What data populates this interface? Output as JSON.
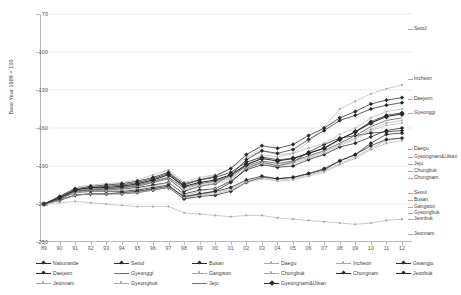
{
  "chart": {
    "type": "line",
    "title": "",
    "ylabel": "Base Year 1989 = 100",
    "xlabel": "",
    "ylim": [
      70,
      250
    ],
    "yticks": [
      "250",
      "220",
      "190",
      "160",
      "130",
      "100",
      "70"
    ],
    "ytick_values": [
      250,
      220,
      190,
      160,
      130,
      100,
      70
    ],
    "grid": true,
    "legend_position": "bottom"
  },
  "chart_data": {
    "type": "line",
    "title": "",
    "xlabel": "",
    "ylabel": "Base Year 1989 = 100",
    "ylim": [
      70,
      250
    ],
    "yticks": [
      70,
      100,
      130,
      160,
      190,
      220,
      250
    ],
    "grid": true,
    "legend_position": "bottom",
    "categories": [
      "89",
      "90",
      "91",
      "92",
      "93",
      "94",
      "95",
      "96",
      "97",
      "98",
      "99",
      "00",
      "01",
      "02",
      "03",
      "04",
      "05",
      "06",
      "07",
      "08",
      "09",
      "10",
      "11",
      "12"
    ],
    "series": [
      {
        "name": "Nationwide",
        "style": "marker-line-dark",
        "values": [
          100,
          105,
          110,
          111,
          111,
          112,
          113,
          115,
          117,
          108,
          111,
          112,
          118,
          127,
          131,
          129,
          130,
          135,
          139,
          145,
          148,
          153,
          158,
          160
        ]
      },
      {
        "name": "Seoul",
        "style": "marker-line-dark",
        "values": [
          100,
          104,
          109,
          110,
          110,
          110,
          111,
          113,
          115,
          105,
          108,
          110,
          117,
          128,
          133,
          130,
          133,
          141,
          147,
          152,
          154,
          156,
          157,
          158
        ]
      },
      {
        "name": "Busan",
        "style": "marker-line-dark",
        "values": [
          100,
          103,
          107,
          108,
          108,
          108,
          109,
          111,
          113,
          104,
          106,
          107,
          110,
          117,
          121,
          120,
          121,
          124,
          127,
          134,
          139,
          148,
          155,
          156
        ]
      },
      {
        "name": "Daegu",
        "style": "thin-light",
        "values": [
          100,
          106,
          113,
          115,
          116,
          117,
          119,
          123,
          127,
          117,
          121,
          123,
          128,
          137,
          142,
          139,
          140,
          144,
          148,
          155,
          160,
          168,
          173,
          175
        ]
      },
      {
        "name": "Incheon",
        "style": "thin-light",
        "values": [
          100,
          104,
          109,
          110,
          110,
          111,
          112,
          114,
          117,
          107,
          110,
          112,
          119,
          131,
          139,
          137,
          140,
          149,
          161,
          175,
          181,
          187,
          191,
          194
        ]
      },
      {
        "name": "Gwangju",
        "style": "marker-line-dark",
        "values": [
          100,
          106,
          112,
          114,
          115,
          116,
          118,
          121,
          125,
          116,
          119,
          121,
          125,
          133,
          137,
          135,
          136,
          140,
          144,
          151,
          157,
          165,
          170,
          172
        ]
      },
      {
        "name": "Daejeon",
        "style": "marker-line-dark",
        "values": [
          100,
          105,
          111,
          113,
          114,
          115,
          117,
          120,
          124,
          115,
          119,
          122,
          128,
          139,
          146,
          144,
          147,
          154,
          160,
          168,
          173,
          179,
          182,
          184
        ]
      },
      {
        "name": "Gyeonggi",
        "style": "marker-line-dark",
        "values": [
          100,
          104,
          110,
          111,
          112,
          113,
          114,
          117,
          120,
          110,
          114,
          116,
          123,
          135,
          142,
          140,
          143,
          151,
          158,
          166,
          170,
          175,
          178,
          180
        ]
      },
      {
        "name": "Gangwon",
        "style": "thin-light",
        "values": [
          100,
          103,
          107,
          108,
          108,
          109,
          110,
          112,
          114,
          106,
          108,
          109,
          112,
          118,
          121,
          119,
          120,
          123,
          126,
          132,
          137,
          144,
          150,
          152
        ]
      },
      {
        "name": "Chungbuk",
        "style": "thin-light",
        "values": [
          100,
          105,
          110,
          112,
          112,
          113,
          115,
          118,
          121,
          112,
          115,
          117,
          121,
          129,
          133,
          131,
          133,
          137,
          141,
          147,
          152,
          159,
          164,
          166
        ]
      },
      {
        "name": "Chungnam",
        "style": "thin-light",
        "values": [
          100,
          104,
          109,
          111,
          111,
          112,
          114,
          117,
          120,
          111,
          114,
          116,
          120,
          128,
          132,
          130,
          132,
          136,
          140,
          146,
          151,
          158,
          162,
          164
        ]
      },
      {
        "name": "Jeonbuk",
        "style": "marker-line-dark",
        "values": [
          100,
          103,
          107,
          108,
          108,
          109,
          110,
          112,
          114,
          106,
          108,
          110,
          113,
          119,
          122,
          120,
          121,
          124,
          128,
          134,
          139,
          146,
          151,
          152
        ]
      },
      {
        "name": "Jeonnam",
        "style": "thin-light",
        "values": [
          100,
          101,
          102,
          101,
          100,
          99,
          98,
          98,
          98,
          93,
          92,
          91,
          90,
          91,
          91,
          89,
          88,
          87,
          86,
          85,
          84,
          85,
          87,
          88
        ]
      },
      {
        "name": "Gyeongbuk",
        "style": "thin-light",
        "values": [
          100,
          103,
          107,
          108,
          108,
          108,
          109,
          111,
          113,
          105,
          107,
          108,
          111,
          117,
          120,
          118,
          119,
          122,
          125,
          131,
          136,
          143,
          148,
          150
        ]
      },
      {
        "name": "Jeju",
        "style": "thick-dark",
        "values": [
          100,
          105,
          110,
          112,
          112,
          113,
          115,
          118,
          121,
          113,
          116,
          118,
          122,
          130,
          134,
          132,
          134,
          138,
          142,
          148,
          154,
          161,
          166,
          168
        ]
      },
      {
        "name": "Gyeongnam&Ulsan",
        "style": "marker-line-bold",
        "values": [
          100,
          105,
          111,
          113,
          113,
          114,
          116,
          119,
          123,
          114,
          117,
          119,
          123,
          131,
          136,
          134,
          136,
          140,
          144,
          151,
          157,
          164,
          169,
          171
        ]
      }
    ]
  },
  "end_labels": [
    {
      "name": "Seoul",
      "top": 26
    },
    {
      "name": "Incheon",
      "top": 76
    },
    {
      "name": "Daejeon",
      "top": 96
    },
    {
      "name": "Gyeonggi",
      "top": 110
    },
    {
      "name": "Daegu",
      "top": 146
    },
    {
      "name": "Gyeongnam&Ulsan",
      "top": 154
    },
    {
      "name": "Jeju",
      "top": 161
    },
    {
      "name": "Chungbuk",
      "top": 168
    },
    {
      "name": "Chungnam",
      "top": 175
    },
    {
      "name": "Seoul",
      "top": 190
    },
    {
      "name": "Busan",
      "top": 197
    },
    {
      "name": "Gangwon",
      "top": 204
    },
    {
      "name": "Gyeongbuk",
      "top": 210
    },
    {
      "name": "Jeonbuk",
      "top": 216
    },
    {
      "name": "Jeonnam",
      "top": 231
    }
  ],
  "legend": {
    "items": [
      {
        "label": "Nationwide",
        "style": "marker-line-dark",
        "col": 0,
        "row": 0
      },
      {
        "label": "Seoul",
        "style": "marker-line-dark",
        "col": 1,
        "row": 0
      },
      {
        "label": "Busan",
        "style": "marker-line-dark",
        "col": 2,
        "row": 0
      },
      {
        "label": "Daegu",
        "style": "thin-light",
        "col": 3,
        "row": 0
      },
      {
        "label": "Incheon",
        "style": "thin-light",
        "col": 4,
        "row": 0
      },
      {
        "label": "Gwangju",
        "style": "marker-line-dark",
        "col": 5,
        "row": 0
      },
      {
        "label": "Daejeon",
        "style": "marker-line-dark",
        "col": 0,
        "row": 1
      },
      {
        "label": "Gyeonggi",
        "style": "thick-dark",
        "col": 1,
        "row": 1
      },
      {
        "label": "Gangwon",
        "style": "thin-light",
        "col": 2,
        "row": 1
      },
      {
        "label": "Chungbuk",
        "style": "thin-light",
        "col": 3,
        "row": 1
      },
      {
        "label": "Chungnam",
        "style": "marker-line-dark",
        "col": 4,
        "row": 1
      },
      {
        "label": "Jeonbuk",
        "style": "marker-line-dark",
        "col": 5,
        "row": 1
      },
      {
        "label": "Jeonnam",
        "style": "thin-light",
        "col": 0,
        "row": 2
      },
      {
        "label": "Gyeongbuk",
        "style": "thin-light",
        "col": 1,
        "row": 2
      },
      {
        "label": "Jeju",
        "style": "thick-dark",
        "col": 2,
        "row": 2
      },
      {
        "label": "Gyeongnam&Ulsan",
        "style": "marker-line-bold",
        "col": 3,
        "row": 2
      }
    ]
  },
  "colors": {
    "line_dark": "#2b2b2b",
    "line_mid": "#6e6e6e",
    "line_light": "#a8a8a8",
    "grid": "#e2e2e2",
    "axis": "#b9b9b9",
    "text": "#3c3c3c",
    "background": "#ffffff"
  }
}
